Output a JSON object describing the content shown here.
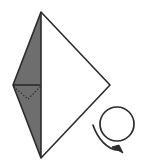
{
  "figure": {
    "canvas": {
      "width": 142,
      "height": 166,
      "background": "#ffffff"
    },
    "colors": {
      "stroke": "#2b2b2b",
      "shaded_face": "#6e6e6e",
      "unshaded_face": "#ffffff",
      "dotted_fold": "#2b2b2b",
      "arrow": "#2b2b2b"
    },
    "shape": {
      "name": "kite",
      "vertices": {
        "top": {
          "x": 41,
          "y": 12
        },
        "left": {
          "x": 13,
          "y": 85
        },
        "bottom": {
          "x": 41,
          "y": 158
        },
        "right": {
          "x": 110,
          "y": 85
        }
      },
      "left_face_fill": "shaded",
      "right_face_fill": "unshaded",
      "center_crease": {
        "from": "top",
        "to": "bottom",
        "style": "solid"
      },
      "horizontal_crease": {
        "from": {
          "x": 13,
          "y": 85
        },
        "to": {
          "x": 41,
          "y": 85
        },
        "style": "solid"
      },
      "dotted_fold_lines": {
        "style": "dotted",
        "points": [
          {
            "x": 14,
            "y": 87
          },
          {
            "x": 28,
            "y": 99
          },
          {
            "x": 40,
            "y": 87
          }
        ]
      }
    },
    "rotation_arrow": {
      "name": "rotate-clockwise",
      "circle": {
        "cx": 117,
        "cy": 124,
        "r": 17
      },
      "tail_start": {
        "x": 93,
        "y": 125
      },
      "arrowhead_tip": {
        "x": 122,
        "y": 152
      },
      "direction": "clockwise"
    }
  },
  "labels": {
    "figure_caption": "",
    "shaded_side_note": "",
    "arrow_note": ""
  }
}
